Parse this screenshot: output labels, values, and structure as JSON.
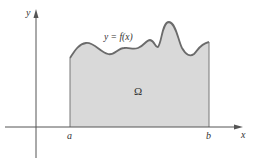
{
  "diagram": {
    "type": "area-under-curve",
    "labels": {
      "y_axis": "y",
      "x_axis": "x",
      "a": "a",
      "b": "b",
      "region": "Ω",
      "curve": "y = f(x)"
    },
    "colors": {
      "fill": "#d9d9d9",
      "curve": "#6b6b6b",
      "axis": "#555555",
      "text": "#333333"
    }
  }
}
